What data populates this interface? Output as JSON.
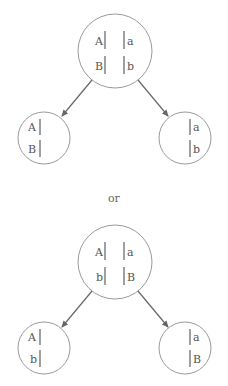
{
  "diagrams": [
    {
      "parent": {
        "rows": [
          {
            "left": "A",
            "right": "a"
          },
          {
            "left": "B",
            "right": "b"
          }
        ]
      },
      "child_left": {
        "rows": [
          "A",
          "B"
        ]
      },
      "child_right": {
        "rows": [
          "a",
          "b"
        ]
      }
    },
    {
      "parent": {
        "rows": [
          {
            "left": "A",
            "right": "a"
          },
          {
            "left": "b",
            "right": "B"
          }
        ]
      },
      "child_left": {
        "rows": [
          "A",
          "b"
        ]
      },
      "child_right": {
        "rows": [
          "a",
          "B"
        ]
      }
    }
  ],
  "separator": "or",
  "colors": {
    "circle": "#9a9a9a",
    "arrow": "#666666",
    "chromosome": "#777777",
    "text": "#555555"
  }
}
